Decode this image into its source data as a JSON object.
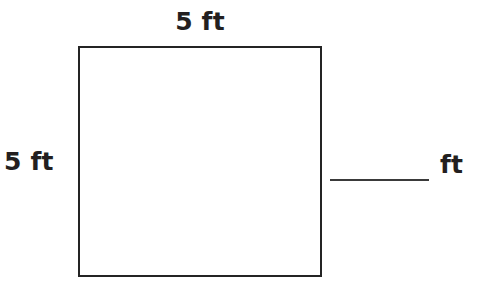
{
  "figure": {
    "shape": "square",
    "top_label": "5 ft",
    "left_label": "5 ft",
    "stroke_color": "#242424",
    "fill_color": "#ffffff"
  },
  "answer": {
    "blank_value": "",
    "unit_label": "ft"
  },
  "page": {
    "background_color": "#ffffff",
    "text_color": "#231f20"
  }
}
